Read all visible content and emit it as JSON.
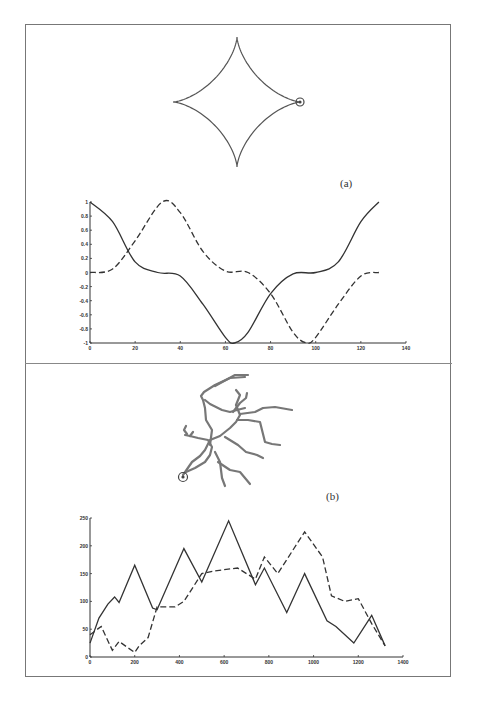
{
  "figure": {
    "panel_a": {
      "label": "(a)",
      "shape": "astroid",
      "marker": "circle-marker"
    },
    "panel_b": {
      "label": "(b)",
      "shape": "branched-contour",
      "marker": "circle-marker"
    }
  },
  "chart_data": [
    {
      "type": "line",
      "title": "",
      "xlabel": "",
      "ylabel": "",
      "xlim": [
        0,
        140
      ],
      "ylim": [
        -1,
        1
      ],
      "xticks": [
        "0",
        "20",
        "40",
        "60",
        "80",
        "100",
        "120",
        "140"
      ],
      "yticks": [
        "1",
        "0.8",
        "0.6",
        "0.4",
        "0.2",
        "0",
        "-0.2",
        "-0.4",
        "-0.6",
        "-0.8",
        "-1"
      ],
      "grid": false,
      "series": [
        {
          "name": "solid",
          "style": "solid",
          "x": [
            0,
            10,
            20,
            30,
            40,
            50,
            60,
            64,
            70,
            80,
            90,
            100,
            110,
            120,
            128
          ],
          "y": [
            1,
            0.72,
            0.15,
            0.0,
            -0.05,
            -0.45,
            -0.92,
            -1.0,
            -0.85,
            -0.3,
            -0.02,
            0.0,
            0.15,
            0.72,
            1.0
          ]
        },
        {
          "name": "dashed",
          "style": "dashed",
          "x": [
            0,
            10,
            20,
            32,
            40,
            50,
            60,
            70,
            80,
            90,
            96,
            100,
            110,
            120,
            128
          ],
          "y": [
            0,
            0.05,
            0.45,
            1.0,
            0.85,
            0.3,
            0.02,
            0.0,
            -0.3,
            -0.85,
            -1.0,
            -0.92,
            -0.45,
            -0.05,
            0.0
          ]
        }
      ]
    },
    {
      "type": "line",
      "title": "",
      "xlabel": "",
      "ylabel": "",
      "xlim": [
        0,
        1400
      ],
      "ylim": [
        0,
        250
      ],
      "xticks": [
        "0",
        "200",
        "400",
        "600",
        "800",
        "1000",
        "1200",
        "1400"
      ],
      "yticks": [
        "0",
        "50",
        "100",
        "150",
        "200",
        "250"
      ],
      "grid": false,
      "series": [
        {
          "name": "solid",
          "style": "solid",
          "x": [
            0,
            40,
            80,
            110,
            130,
            200,
            280,
            300,
            420,
            500,
            620,
            740,
            780,
            880,
            960,
            1060,
            1100,
            1180,
            1260,
            1320
          ],
          "y": [
            25,
            70,
            95,
            108,
            98,
            165,
            88,
            85,
            195,
            135,
            245,
            130,
            160,
            80,
            150,
            65,
            55,
            25,
            75,
            20
          ]
        },
        {
          "name": "dashed",
          "style": "dashed",
          "x": [
            0,
            50,
            100,
            130,
            200,
            220,
            260,
            300,
            380,
            420,
            500,
            560,
            660,
            740,
            780,
            840,
            960,
            1040,
            1080,
            1140,
            1200,
            1260,
            1320
          ],
          "y": [
            40,
            55,
            12,
            28,
            8,
            20,
            35,
            90,
            90,
            100,
            150,
            155,
            160,
            140,
            180,
            150,
            225,
            180,
            110,
            100,
            105,
            60,
            20
          ]
        }
      ]
    }
  ]
}
